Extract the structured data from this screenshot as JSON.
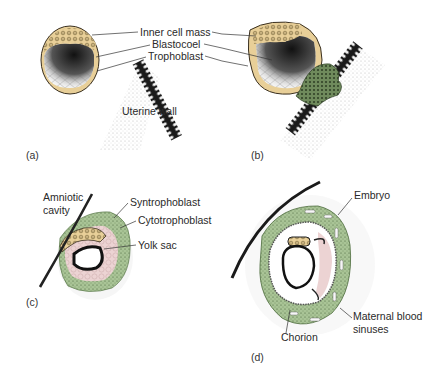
{
  "figure": {
    "panels": [
      {
        "id": "a",
        "tag": "(a)",
        "labels": {
          "inner_cell_mass": "Inner cell mass",
          "blastocoel": "Blastocoel",
          "trophoblast": "Trophoblast",
          "uterine_wall": "Uterine wall"
        }
      },
      {
        "id": "b",
        "tag": "(b)"
      },
      {
        "id": "c",
        "tag": "(c)",
        "labels": {
          "amniotic_cavity_line1": "Amniotic",
          "amniotic_cavity_line2": "cavity",
          "syntrophoblast": "Syntrophoblast",
          "cytotrophoblast": "Cytotrophoblast",
          "yolk_sac": "Yolk sac"
        }
      },
      {
        "id": "d",
        "tag": "(d)",
        "labels": {
          "embryo": "Embryo",
          "maternal_line1": "Maternal blood",
          "maternal_line2": "sinuses",
          "chorion": "Chorion"
        }
      }
    ],
    "colors": {
      "trophoblast_tan": "#e8cf98",
      "syncytium_green": "#a9c496",
      "cytotroph_pink": "#ecd3d3",
      "wall_black": "#1a1a1a",
      "stipple_gray": "#d8d8d8"
    }
  }
}
